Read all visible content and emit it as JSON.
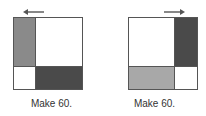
{
  "figures": [
    {
      "label": "Make 60.",
      "arrow_direction": "left",
      "cells": {
        "top_left": "#8a8a8a",
        "top_right": "#ffffff",
        "bottom_left": "#ffffff",
        "bottom_right": "#4a4a4a"
      }
    },
    {
      "label": "Make 60.",
      "arrow_direction": "right",
      "cells": {
        "top_left": "#ffffff",
        "top_right": "#4a4a4a",
        "bottom_left": "#a8a8a8",
        "bottom_right": "#ffffff"
      }
    }
  ]
}
